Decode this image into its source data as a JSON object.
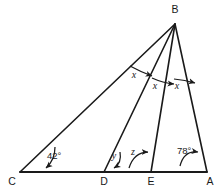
{
  "figure": {
    "background_color": "#ffffff",
    "stroke_color": "#1a1a1a",
    "vertices": [
      {
        "name": "B",
        "label": "B",
        "x": 175,
        "y": 24
      },
      {
        "name": "C",
        "label": "C",
        "x": 20,
        "y": 172
      },
      {
        "name": "D",
        "label": "D",
        "x": 104,
        "y": 172
      },
      {
        "name": "E",
        "label": "E",
        "x": 151,
        "y": 172
      },
      {
        "name": "A",
        "label": "A",
        "x": 207,
        "y": 172
      }
    ],
    "vertex_labels": {
      "B": "B",
      "C": "C",
      "D": "D",
      "E": "E",
      "A": "A"
    },
    "segments": [
      {
        "name": "base-CA",
        "from": "C",
        "to": "A"
      },
      {
        "name": "side-CB",
        "from": "C",
        "to": "B"
      },
      {
        "name": "cevian-DB",
        "from": "D",
        "to": "B"
      },
      {
        "name": "cevian-EB",
        "from": "E",
        "to": "B"
      },
      {
        "name": "side-AB",
        "from": "A",
        "to": "B"
      }
    ],
    "angle_labels": [
      {
        "name": "angle-C",
        "text": "42°",
        "x": 47,
        "y": 159,
        "style": "plain"
      },
      {
        "name": "angle-A",
        "text": "78°",
        "x": 177,
        "y": 154,
        "style": "plain"
      },
      {
        "name": "angle-y",
        "text": "y",
        "x": 114,
        "y": 159,
        "style": "italic"
      },
      {
        "name": "angle-z",
        "text": "z",
        "x": 133,
        "y": 155,
        "style": "italic"
      },
      {
        "name": "angle-x1",
        "text": "x",
        "x": 134,
        "y": 76,
        "style": "italic"
      },
      {
        "name": "angle-x2",
        "text": "x",
        "x": 155,
        "y": 87,
        "style": "italic"
      },
      {
        "name": "angle-x3",
        "text": "x",
        "x": 177,
        "y": 87,
        "style": "italic"
      }
    ],
    "angle_values": {
      "C": "42°",
      "A": "78°",
      "D_interior": "y",
      "E_interior": "z",
      "B_part_1": "x",
      "B_part_2": "x",
      "B_part_3": "x"
    }
  }
}
